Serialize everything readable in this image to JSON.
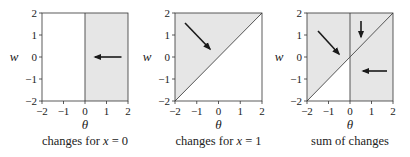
{
  "figure": {
    "axis_range": [
      -2,
      2
    ],
    "ticks": [
      "−2",
      "−1",
      "0",
      "1",
      "2"
    ],
    "xlabel": "θ",
    "ylabel": "w",
    "shade_color": "#e6e6e6",
    "line_color": "#555555",
    "arrow_color": "#1a1a1a",
    "panels": [
      {
        "caption": "changes for x = 0",
        "caption_plain": "changes for ",
        "caption_var": "x",
        "caption_eq": " = 0",
        "shading": "theta > 0",
        "boundaries": [
          "theta = 0"
        ],
        "arrows": [
          {
            "from": [
              1.7,
              0
            ],
            "to": [
              0.4,
              0
            ]
          }
        ]
      },
      {
        "caption": "changes for x = 1",
        "caption_plain": "changes for ",
        "caption_var": "x",
        "caption_eq": " = 1",
        "shading": "w > theta",
        "boundaries": [
          "w = theta"
        ],
        "arrows": [
          {
            "from": [
              -1.55,
              1.55
            ],
            "to": [
              -0.35,
              0.35
            ]
          }
        ]
      },
      {
        "caption": "sum of changes",
        "caption_plain": "sum of changes",
        "caption_var": "",
        "caption_eq": "",
        "shading": "theta > 0 or w > theta",
        "boundaries": [
          "theta = 0",
          "w = theta"
        ],
        "arrows": [
          {
            "from": [
              -1.5,
              1.2
            ],
            "to": [
              -0.5,
              0.15
            ]
          },
          {
            "from": [
              0.5,
              1.5
            ],
            "to": [
              0.5,
              0.8
            ]
          },
          {
            "from": [
              1.7,
              -0.65
            ],
            "to": [
              0.55,
              -0.65
            ]
          }
        ]
      }
    ]
  }
}
